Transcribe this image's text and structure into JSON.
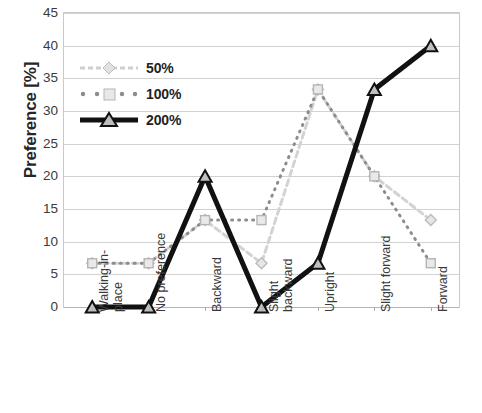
{
  "chart": {
    "ylabel": "Preference [%]",
    "y_ticks": [
      "45",
      "40",
      "35",
      "30",
      "25",
      "20",
      "15",
      "10",
      "5",
      "0"
    ],
    "legend": [
      {
        "label": "50%",
        "style": "light-gray-dashed-diamond"
      },
      {
        "label": "100%",
        "style": "gray-dotted-square"
      },
      {
        "label": "200%",
        "style": "black-solid-triangle"
      }
    ]
  },
  "chart_data": {
    "type": "line",
    "title": "",
    "xlabel": "",
    "ylabel": "Preference [%]",
    "ylim": [
      0,
      45
    ],
    "ytick_step": 5,
    "grid": true,
    "legend_position": "upper-left-inside",
    "categories": [
      "Walking-in-place",
      "No preference",
      "Backward",
      "Slight backward",
      "Upright",
      "Slight forward",
      "Forward"
    ],
    "series": [
      {
        "name": "50%",
        "color": "#cdcdcd",
        "marker": "diamond",
        "linestyle": "dashed",
        "values": [
          6.7,
          6.7,
          13.3,
          6.7,
          33.3,
          20.0,
          13.3
        ]
      },
      {
        "name": "100%",
        "color": "#8c8c8c",
        "marker": "square",
        "linestyle": "dotted",
        "values": [
          6.7,
          6.7,
          13.3,
          13.3,
          33.3,
          20.0,
          6.7
        ]
      },
      {
        "name": "200%",
        "color": "#111111",
        "marker": "triangle",
        "linestyle": "solid",
        "values": [
          0.0,
          0.0,
          20.0,
          0.0,
          6.7,
          33.3,
          40.0
        ]
      }
    ]
  }
}
